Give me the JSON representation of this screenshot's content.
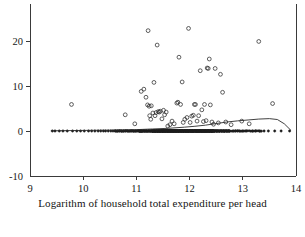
{
  "chart_data": {
    "type": "scatter",
    "title": "",
    "xlabel": "Logarithm of household total expenditure per head",
    "ylabel": "",
    "xlim": [
      9,
      14
    ],
    "ylim": [
      -10,
      25
    ],
    "xticks": [
      9,
      10,
      11,
      12,
      13,
      14
    ],
    "xticklabels": [
      "9",
      "10",
      "11",
      "12",
      "13",
      "14"
    ],
    "yticks": [
      -10,
      0,
      10,
      20
    ],
    "yticklabels": [
      "-10",
      "0",
      "10",
      "20"
    ],
    "grid": false,
    "legend": null,
    "marker": "open-circle",
    "series": [
      {
        "name": "observations",
        "points": [
          [
            9.42,
            0.0
          ],
          [
            9.47,
            0.0
          ],
          [
            9.55,
            0.0
          ],
          [
            9.62,
            0.0
          ],
          [
            9.7,
            0.0
          ],
          [
            9.78,
            5.9
          ],
          [
            9.8,
            0.0
          ],
          [
            9.88,
            0.0
          ],
          [
            9.95,
            0.0
          ],
          [
            10.02,
            0.0
          ],
          [
            10.1,
            0.0
          ],
          [
            10.16,
            0.0
          ],
          [
            10.22,
            0.0
          ],
          [
            10.28,
            0.0
          ],
          [
            10.33,
            0.0
          ],
          [
            10.38,
            0.0
          ],
          [
            10.42,
            0.0
          ],
          [
            10.47,
            0.0
          ],
          [
            10.52,
            0.0
          ],
          [
            10.56,
            0.0
          ],
          [
            10.6,
            0.0
          ],
          [
            10.64,
            0.0
          ],
          [
            10.68,
            0.0
          ],
          [
            10.72,
            0.0
          ],
          [
            10.76,
            0.0
          ],
          [
            10.79,
            3.6
          ],
          [
            10.8,
            0.0
          ],
          [
            10.84,
            0.0
          ],
          [
            10.88,
            0.0
          ],
          [
            10.91,
            0.0
          ],
          [
            10.94,
            0.0
          ],
          [
            10.97,
            1.6
          ],
          [
            10.98,
            0.0
          ],
          [
            11.01,
            0.0
          ],
          [
            11.04,
            0.0
          ],
          [
            11.07,
            0.0
          ],
          [
            11.09,
            8.8
          ],
          [
            11.1,
            0.0
          ],
          [
            11.13,
            0.0
          ],
          [
            11.14,
            9.3
          ],
          [
            11.16,
            0.0
          ],
          [
            11.18,
            7.5
          ],
          [
            11.19,
            0.0
          ],
          [
            11.21,
            5.8
          ],
          [
            11.22,
            22.3
          ],
          [
            11.23,
            0.0
          ],
          [
            11.24,
            5.5
          ],
          [
            11.25,
            3.4
          ],
          [
            11.26,
            0.0
          ],
          [
            11.27,
            2.6
          ],
          [
            11.28,
            5.6
          ],
          [
            11.29,
            0.0
          ],
          [
            11.3,
            0.0
          ],
          [
            11.31,
            4.0
          ],
          [
            11.32,
            0.0
          ],
          [
            11.33,
            10.8
          ],
          [
            11.34,
            0.0
          ],
          [
            11.35,
            3.4
          ],
          [
            11.36,
            0.0
          ],
          [
            11.37,
            4.1
          ],
          [
            11.38,
            0.0
          ],
          [
            11.39,
            19.1
          ],
          [
            11.4,
            0.0
          ],
          [
            11.41,
            4.3
          ],
          [
            11.42,
            0.0
          ],
          [
            11.43,
            4.2
          ],
          [
            11.44,
            0.0
          ],
          [
            11.45,
            4.4
          ],
          [
            11.46,
            0.0
          ],
          [
            11.47,
            0.0
          ],
          [
            11.48,
            2.7
          ],
          [
            11.49,
            0.0
          ],
          [
            11.5,
            0.0
          ],
          [
            11.51,
            4.6
          ],
          [
            11.52,
            0.0
          ],
          [
            11.53,
            3.6
          ],
          [
            11.54,
            0.0
          ],
          [
            11.55,
            0.0
          ],
          [
            11.56,
            4.2
          ],
          [
            11.57,
            0.0
          ],
          [
            11.58,
            0.0
          ],
          [
            11.59,
            1.1
          ],
          [
            11.6,
            0.0
          ],
          [
            11.61,
            0.0
          ],
          [
            11.62,
            0.0
          ],
          [
            11.63,
            1.4
          ],
          [
            11.64,
            0.0
          ],
          [
            11.65,
            0.0
          ],
          [
            11.66,
            0.0
          ],
          [
            11.67,
            2.2
          ],
          [
            11.68,
            0.0
          ],
          [
            11.69,
            0.0
          ],
          [
            11.7,
            0.0
          ],
          [
            11.71,
            1.6
          ],
          [
            11.72,
            0.0
          ],
          [
            11.73,
            0.0
          ],
          [
            11.74,
            0.0
          ],
          [
            11.75,
            0.0
          ],
          [
            11.76,
            6.2
          ],
          [
            11.77,
            0.0
          ],
          [
            11.78,
            6.4
          ],
          [
            11.79,
            0.0
          ],
          [
            11.8,
            16.4
          ],
          [
            11.81,
            0.0
          ],
          [
            11.82,
            0.0
          ],
          [
            11.83,
            5.9
          ],
          [
            11.84,
            0.0
          ],
          [
            11.85,
            0.0
          ],
          [
            11.86,
            10.9
          ],
          [
            11.87,
            0.0
          ],
          [
            11.88,
            1.9
          ],
          [
            11.89,
            0.0
          ],
          [
            11.9,
            0.0
          ],
          [
            11.91,
            2.6
          ],
          [
            11.92,
            0.0
          ],
          [
            11.93,
            0.0
          ],
          [
            11.94,
            0.0
          ],
          [
            11.95,
            3.0
          ],
          [
            11.96,
            0.0
          ],
          [
            11.97,
            0.0
          ],
          [
            11.98,
            22.8
          ],
          [
            11.99,
            0.0
          ],
          [
            12.0,
            0.0
          ],
          [
            12.01,
            1.9
          ],
          [
            12.02,
            0.0
          ],
          [
            12.03,
            0.0
          ],
          [
            12.04,
            3.3
          ],
          [
            12.05,
            0.0
          ],
          [
            12.06,
            0.0
          ],
          [
            12.07,
            3.5
          ],
          [
            12.08,
            0.0
          ],
          [
            12.09,
            5.9
          ],
          [
            12.1,
            0.0
          ],
          [
            12.11,
            5.9
          ],
          [
            12.12,
            0.0
          ],
          [
            12.13,
            0.0
          ],
          [
            12.14,
            2.2
          ],
          [
            12.15,
            0.0
          ],
          [
            12.16,
            0.0
          ],
          [
            12.17,
            3.4
          ],
          [
            12.18,
            0.0
          ],
          [
            12.19,
            0.0
          ],
          [
            12.2,
            13.4
          ],
          [
            12.21,
            0.0
          ],
          [
            12.22,
            0.0
          ],
          [
            12.23,
            4.7
          ],
          [
            12.24,
            0.0
          ],
          [
            12.25,
            0.0
          ],
          [
            12.26,
            2.1
          ],
          [
            12.27,
            0.0
          ],
          [
            12.28,
            5.9
          ],
          [
            12.29,
            0.0
          ],
          [
            12.3,
            0.0
          ],
          [
            12.31,
            2.3
          ],
          [
            12.32,
            0.0
          ],
          [
            12.33,
            14.0
          ],
          [
            12.34,
            0.0
          ],
          [
            12.35,
            13.9
          ],
          [
            12.36,
            0.0
          ],
          [
            12.37,
            16.0
          ],
          [
            12.38,
            0.0
          ],
          [
            12.39,
            5.8
          ],
          [
            12.4,
            0.0
          ],
          [
            12.41,
            0.0
          ],
          [
            12.42,
            2.0
          ],
          [
            12.43,
            0.0
          ],
          [
            12.44,
            0.0
          ],
          [
            12.45,
            1.5
          ],
          [
            12.46,
            0.0
          ],
          [
            12.47,
            0.0
          ],
          [
            12.48,
            13.9
          ],
          [
            12.5,
            0.0
          ],
          [
            12.52,
            0.0
          ],
          [
            12.54,
            1.8
          ],
          [
            12.56,
            0.0
          ],
          [
            12.58,
            12.6
          ],
          [
            12.6,
            0.0
          ],
          [
            12.62,
            8.6
          ],
          [
            12.64,
            0.0
          ],
          [
            12.66,
            0.0
          ],
          [
            12.68,
            2.0
          ],
          [
            12.7,
            0.0
          ],
          [
            12.74,
            0.0
          ],
          [
            12.78,
            1.4
          ],
          [
            12.82,
            0.0
          ],
          [
            12.86,
            0.0
          ],
          [
            12.9,
            0.0
          ],
          [
            12.94,
            0.0
          ],
          [
            12.98,
            2.2
          ],
          [
            13.0,
            0.0
          ],
          [
            13.06,
            0.0
          ],
          [
            13.12,
            1.6
          ],
          [
            13.18,
            0.0
          ],
          [
            13.24,
            0.0
          ],
          [
            13.3,
            19.9
          ],
          [
            13.32,
            0.0
          ],
          [
            13.4,
            0.0
          ],
          [
            13.48,
            0.0
          ],
          [
            13.56,
            6.1
          ],
          [
            13.6,
            0.0
          ],
          [
            13.72,
            0.0
          ],
          [
            13.88,
            0.0
          ]
        ]
      }
    ],
    "smooth_curve": {
      "name": "nonparametric-regression",
      "points": [
        [
          9.4,
          0.05
        ],
        [
          9.8,
          0.1
        ],
        [
          10.2,
          0.15
        ],
        [
          10.6,
          0.2
        ],
        [
          11.0,
          0.3
        ],
        [
          11.3,
          0.45
        ],
        [
          11.6,
          0.6
        ],
        [
          11.9,
          0.85
        ],
        [
          12.1,
          1.05
        ],
        [
          12.3,
          1.3
        ],
        [
          12.5,
          1.65
        ],
        [
          12.7,
          2.0
        ],
        [
          12.9,
          2.25
        ],
        [
          13.1,
          2.45
        ],
        [
          13.3,
          2.65
        ],
        [
          13.5,
          2.75
        ],
        [
          13.65,
          2.55
        ],
        [
          13.78,
          1.6
        ],
        [
          13.9,
          0.2
        ]
      ]
    }
  },
  "axis": {
    "x_label_text": "Logarithm of household total expenditure per head"
  }
}
